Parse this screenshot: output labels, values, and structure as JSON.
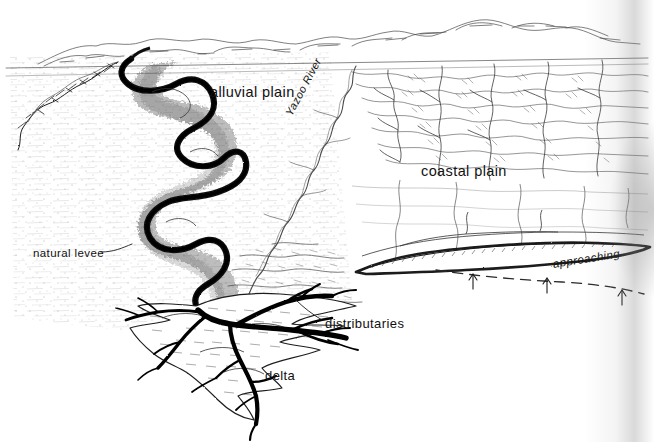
{
  "figure": {
    "type": "diagram",
    "style": "pen-and-ink line drawing, black on white",
    "background_color": "#ffffff",
    "ink_color": "#111111"
  },
  "labels": {
    "alluvial_plain": "alluvial plain",
    "coastal_plain": "coastal plain",
    "natural_levee": "natural levee",
    "distributaries": "distributaries",
    "delta": "delta",
    "yazoo_river": "Yazoo River",
    "approaching": "approaching"
  },
  "annotations": {
    "leader_lines": [
      "natural-levee-leader",
      "distributaries-leader"
    ],
    "dashed_line": "approaching-shoreline-dashed-line",
    "arrow_count": 3,
    "arrow_direction": "up"
  },
  "features": [
    "distant-hills-horizon",
    "meandering-main-river",
    "stippled-alluvial-plain",
    "yazoo-tributary-river",
    "dissected-upland-terrain",
    "barrier-shoreline",
    "birdsfoot-delta",
    "distributary-channels"
  ]
}
